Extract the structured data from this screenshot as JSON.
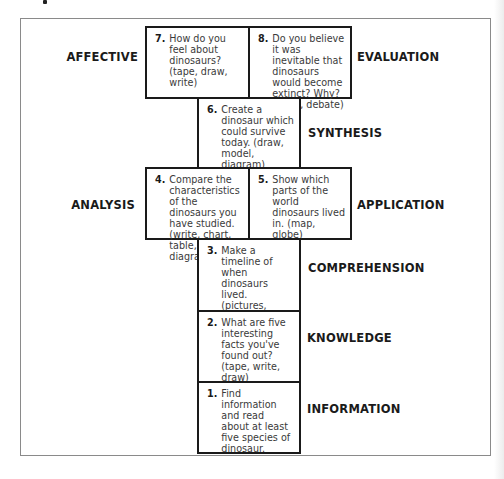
{
  "diagram": {
    "levels": [
      {
        "id": "affective",
        "label": "AFFECTIVE"
      },
      {
        "id": "evaluation",
        "label": "EVALUATION"
      },
      {
        "id": "synthesis",
        "label": "SYNTHESIS"
      },
      {
        "id": "analysis",
        "label": "ANALYSIS"
      },
      {
        "id": "application",
        "label": "APPLICATION"
      },
      {
        "id": "comprehension",
        "label": "COMPREHENSION"
      },
      {
        "id": "knowledge",
        "label": "KNOWLEDGE"
      },
      {
        "id": "information",
        "label": "INFORMATION"
      }
    ],
    "activities": {
      "a7": {
        "num": "7.",
        "text": "How do you feel about dinosaurs? (tape, draw, write)",
        "level": "AFFECTIVE"
      },
      "a8": {
        "num": "8.",
        "text": "Do you believe it was inevitable that dinosaurs would become extinct? Why? (write, debate)",
        "level": "EVALUATION"
      },
      "a6": {
        "num": "6.",
        "text": "Create a dinosaur which could survive today. (draw, model, diagram)",
        "level": "SYNTHESIS"
      },
      "a4": {
        "num": "4.",
        "text": "Compare the characteristics of the dinosaurs you have studied. (write, chart, table, Venn diagram)",
        "level": "ANALYSIS"
      },
      "a5": {
        "num": "5.",
        "text": "Show which parts of the world dinosaurs lived in. (map, globe)",
        "level": "APPLICATION"
      },
      "a3": {
        "num": "3.",
        "text": "Make a timeline of when dinosaurs lived. (pictures, words, model)",
        "level": "COMPREHENSION"
      },
      "a2": {
        "num": "2.",
        "text": "What are five interesting facts you've found out? (tape, write, draw)",
        "level": "KNOWLEDGE"
      },
      "a1": {
        "num": "1.",
        "text": "Find information and read about at least five species of dinosaur.",
        "level": "INFORMATION"
      }
    },
    "labels": {
      "affective": "AFFECTIVE",
      "evaluation": "EVALUATION",
      "synthesis": "SYNTHESIS",
      "analysis": "ANALYSIS",
      "application": "APPLICATION",
      "comprehension": "COMPREHENSION",
      "knowledge": "KNOWLEDGE",
      "information": "INFORMATION"
    },
    "colors": {
      "border": "#1a1a1a",
      "frame": "#8a8a8a",
      "text": "#3a3a3a",
      "background": "#ffffff"
    }
  }
}
